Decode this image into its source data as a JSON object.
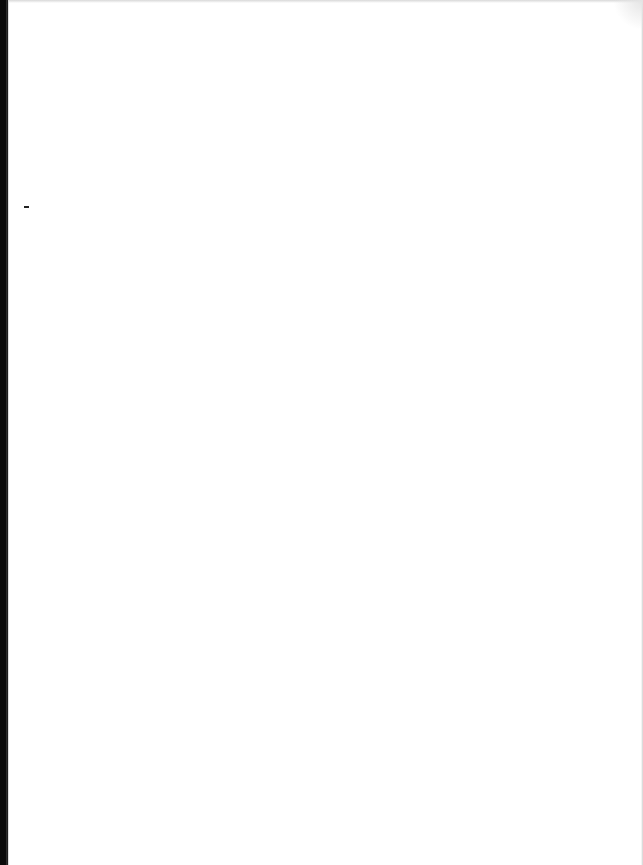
{
  "page": {
    "type": "scanned-blank-page",
    "text": "",
    "colors": {
      "paper": "#ffffff",
      "binding_edge": "#0a0a0a"
    }
  }
}
